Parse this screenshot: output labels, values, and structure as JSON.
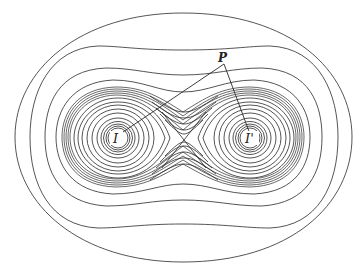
{
  "figure": {
    "labels": {
      "point_p": "P",
      "focus_left": "I",
      "focus_right": "I'"
    },
    "colors": {
      "line": "#2a2a2a",
      "background": "#ffffff"
    },
    "points": {
      "P": [
        224,
        64
      ],
      "I": [
        118,
        136
      ],
      "I_prime": [
        250,
        136
      ],
      "saddle": [
        184,
        140
      ]
    }
  }
}
